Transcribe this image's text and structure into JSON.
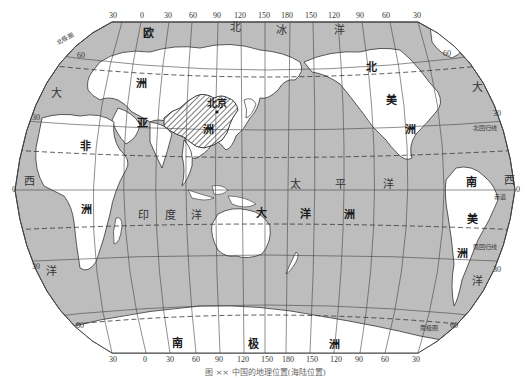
{
  "map": {
    "type": "world political map (Pacific-centered, Robinson-like projection)",
    "highlight": "China (hatched)",
    "colors": {
      "ocean": "#bdbdbd",
      "land": "#ffffff",
      "graticule": "#444444",
      "highlight_hatch": "#333333",
      "background": "#ffffff"
    }
  },
  "top_ticks": [
    "30",
    "0",
    "30",
    "60",
    "90",
    "120",
    "150",
    "180",
    "150",
    "120",
    "90",
    "60",
    "30"
  ],
  "bottom_ticks": [
    "30",
    "0",
    "30",
    "60",
    "90",
    "120",
    "150",
    "180",
    "150",
    "120",
    "90",
    "60",
    "30"
  ],
  "left_ticks": [
    "60",
    "30",
    "0",
    "30",
    "60"
  ],
  "right_ticks": [
    "60",
    "30",
    "0",
    "30",
    "60"
  ],
  "continents": {
    "asia": [
      "亚",
      "洲"
    ],
    "europe": [
      "欧"
    ],
    "africa": [
      "非",
      "洲"
    ],
    "north_america": [
      "北",
      "美",
      "洲"
    ],
    "south_america": [
      "南",
      "美",
      "洲"
    ],
    "oceania": [
      "大",
      "洋",
      "洲"
    ],
    "antarctica": [
      "南",
      "极",
      "洲"
    ]
  },
  "oceans": {
    "arctic": [
      "北",
      "冰",
      "洋"
    ],
    "atlantic_left": [
      "大",
      "西",
      "洋"
    ],
    "atlantic_right": [
      "大",
      "西",
      "洋"
    ],
    "indian": [
      "印",
      "度",
      "洋"
    ],
    "pacific": [
      "太",
      "平",
      "洋"
    ]
  },
  "places": {
    "beijing": "北京"
  },
  "reference_lines": {
    "arctic_circle": "北极圈",
    "tropic_of_cancer": "北回归线",
    "equator": "赤道",
    "tropic_of_capricorn": "南回归线",
    "antarctic_circle": "南极圈"
  },
  "caption": "图 ××  中国的地理位置(海陆位置)"
}
